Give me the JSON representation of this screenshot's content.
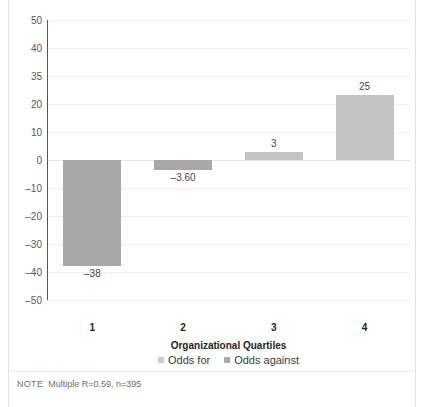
{
  "chart_data": {
    "type": "bar",
    "title": "",
    "categories": [
      "1",
      "2",
      "3",
      "4"
    ],
    "values": [
      -38,
      -3.6,
      3,
      25
    ],
    "value_labels": [
      "–38",
      "–3.60",
      "3",
      "25"
    ],
    "series": [
      {
        "name": "Odds for",
        "color": "#cccccc"
      },
      {
        "name": "Odds against",
        "color": "#a8a8a8"
      }
    ],
    "bar_series": [
      "Odds against",
      "Odds against",
      "Odds for",
      "Odds for"
    ],
    "xlabel": "Organizational Quartiles",
    "ylabel": "",
    "ylim": [
      -50,
      50
    ],
    "yticks": [
      50,
      40,
      35,
      20,
      10,
      0,
      -10,
      -20,
      -30,
      -40,
      -50
    ],
    "ytick_labels": [
      "50",
      "40",
      "35",
      "20",
      "10",
      "0",
      "–10",
      "–20",
      "–30",
      "–40",
      "–50"
    ],
    "grid": true,
    "legend_position": "bottom"
  },
  "legend": {
    "items": [
      {
        "label": "Odds for"
      },
      {
        "label": "Odds against"
      }
    ]
  },
  "note": {
    "tag": "NOTE",
    "text": "Multiple R=0.59, n=395"
  },
  "colors": {
    "bar_light": "#c4c4c4",
    "bar_dark": "#a8a8a8",
    "axis": "#58585a",
    "grid": "#f0f0f0",
    "text": "#232323"
  }
}
